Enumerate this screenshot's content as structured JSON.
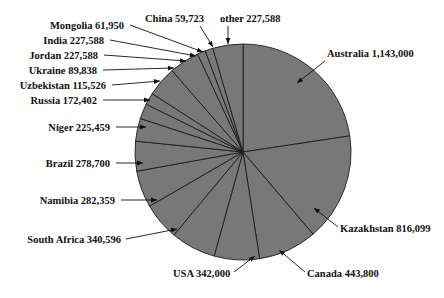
{
  "figure": {
    "title": "",
    "pie_fill_color": "#787878",
    "pie_edge_color": "#1c1c1c",
    "background_color": "#ffffff",
    "label_color": "#111111"
  },
  "geometry": {
    "center_x": 243,
    "center_y": 152,
    "radius": 108,
    "start_angle_deg": -90,
    "direction": "clockwise"
  },
  "chart_data": {
    "type": "pie",
    "title": "",
    "value_label": "",
    "legend_position": "callout-labels",
    "categories": [
      "Australia",
      "Kazakhstan",
      "Canada",
      "USA",
      "South Africa",
      "Namibia",
      "Brazil",
      "Niger",
      "Russia",
      "Uzbekistan",
      "Ukraine",
      "Jordan",
      "India",
      "Mongolia",
      "China",
      "other"
    ],
    "values": [
      1143000,
      816099,
      443800,
      342000,
      340596,
      282359,
      278700,
      225459,
      172402,
      115526,
      89838,
      227588,
      227588,
      61950,
      59723,
      227588
    ],
    "value_labels": [
      "1,143,000",
      "816,099",
      "443,800",
      "342,000",
      "340,596",
      "282,359",
      "278,700",
      "225,459",
      "172,402",
      "115,526",
      "89,838",
      "227,588",
      "227,588",
      "61,950",
      "59,723",
      "227,588"
    ]
  },
  "callouts": [
    {
      "name": "australia",
      "text": "Australia 1,143,000",
      "tx": 327,
      "ty": 57,
      "anchor": "start",
      "lx": 325,
      "ly": 61,
      "ax": 297,
      "ay": 83
    },
    {
      "name": "kazakhstan",
      "text": "Kazakhstan 816,099",
      "tx": 340,
      "ty": 232,
      "anchor": "start",
      "lx": 338,
      "ly": 227,
      "ax": 314,
      "ay": 208
    },
    {
      "name": "canada",
      "text": "Canada 443,800",
      "tx": 307,
      "ty": 277,
      "anchor": "start",
      "lx": 305,
      "ly": 272,
      "ax": 279,
      "ay": 250
    },
    {
      "name": "usa",
      "text": "USA 342,000",
      "tx": 173,
      "ty": 277,
      "anchor": "start",
      "lx": 234,
      "ly": 272,
      "ax": 255,
      "ay": 256
    },
    {
      "name": "south-africa",
      "text": "South Africa 340,596",
      "tx": 121,
      "ty": 243,
      "anchor": "end",
      "lx": 126,
      "ly": 239,
      "ax": 177,
      "ay": 229
    },
    {
      "name": "namibia",
      "text": "Namibia 282,359",
      "tx": 115,
      "ty": 204,
      "anchor": "end",
      "lx": 121,
      "ly": 200,
      "ax": 157,
      "ay": 200
    },
    {
      "name": "brazil",
      "text": "Brazil 278,700",
      "tx": 110,
      "ty": 167,
      "anchor": "end",
      "lx": 116,
      "ly": 163,
      "ax": 143,
      "ay": 163
    },
    {
      "name": "niger",
      "text": "Niger 225,459",
      "tx": 110,
      "ty": 131,
      "anchor": "end",
      "lx": 116,
      "ly": 127,
      "ax": 146,
      "ay": 127
    },
    {
      "name": "russia",
      "text": "Russia 172,402",
      "tx": 97,
      "ty": 104,
      "anchor": "end",
      "lx": 103,
      "ly": 100,
      "ax": 150,
      "ay": 100
    },
    {
      "name": "uzbekistan",
      "text": "Uzbekistan 115,526",
      "tx": 106,
      "ty": 89,
      "anchor": "end",
      "lx": 112,
      "ly": 85,
      "ax": 160,
      "ay": 81
    },
    {
      "name": "ukraine",
      "text": "Ukraine 89,838",
      "tx": 97,
      "ty": 74,
      "anchor": "end",
      "lx": 103,
      "ly": 70,
      "ax": 174,
      "ay": 68
    },
    {
      "name": "jordan",
      "text": "Jordan  227,588",
      "tx": 98,
      "ty": 59,
      "anchor": "end",
      "lx": 104,
      "ly": 55,
      "ax": 186,
      "ay": 61
    },
    {
      "name": "india",
      "text": "India  227,588",
      "tx": 104,
      "ty": 44,
      "anchor": "end",
      "lx": 110,
      "ly": 40,
      "ax": 196,
      "ay": 56
    },
    {
      "name": "mongolia",
      "text": "Mongolia 61,950",
      "tx": 124,
      "ty": 29,
      "anchor": "end",
      "lx": 130,
      "ly": 25,
      "ax": 203,
      "ay": 52
    },
    {
      "name": "china",
      "text": "China  59,723",
      "tx": 145,
      "ty": 22,
      "anchor": "start",
      "lx": 200,
      "ly": 26,
      "ax": 213,
      "ay": 47
    },
    {
      "name": "other",
      "text": "other  227,588",
      "tx": 220,
      "ty": 22,
      "anchor": "start",
      "lx": 228,
      "ly": 26,
      "ax": 228,
      "ay": 44
    }
  ],
  "footer": {
    "caption": ""
  }
}
